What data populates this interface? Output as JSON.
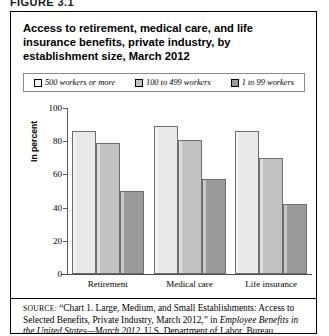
{
  "figure_label": "FIGURE 3.1",
  "chart_title": "Access to retirement, medical care, and life insurance benefits, private industry, by establishment size, March 2012",
  "source": {
    "prefix": "SOURCE:",
    "part1": " “Chart 1. Large, Medium, and Small Establishments: Access to Selected Benefits, Private Industry, March 2012,” in ",
    "italic1": "Employee Benefits in the United States—March 2012",
    "part2": ", U.S. Department of Labor, Bureau"
  },
  "colors": {
    "series1": "#e9e9e9",
    "series2": "#c2c2c2",
    "series3": "#9a9a9a",
    "axis": "#5a5a5a",
    "border": "#000000"
  },
  "chart_data": {
    "type": "bar",
    "title": "Access to retirement, medical care, and life insurance benefits, private industry, by establishment size, March 2012",
    "xlabel": "",
    "ylabel": "In percent",
    "ylim": [
      0,
      100
    ],
    "yticks": [
      0,
      20,
      40,
      60,
      80,
      100
    ],
    "grid": false,
    "legend_position": "top",
    "categories": [
      "Retirement",
      "Medical care",
      "Life insurance"
    ],
    "series": [
      {
        "name": "500 workers or more",
        "color": "#e9e9e9",
        "values": [
          86,
          89,
          86
        ]
      },
      {
        "name": "100 to 499 workers",
        "color": "#c2c2c2",
        "values": [
          79,
          81,
          70
        ]
      },
      {
        "name": "1 to 99 workers",
        "color": "#9a9a9a",
        "values": [
          50,
          57,
          42
        ]
      }
    ]
  }
}
